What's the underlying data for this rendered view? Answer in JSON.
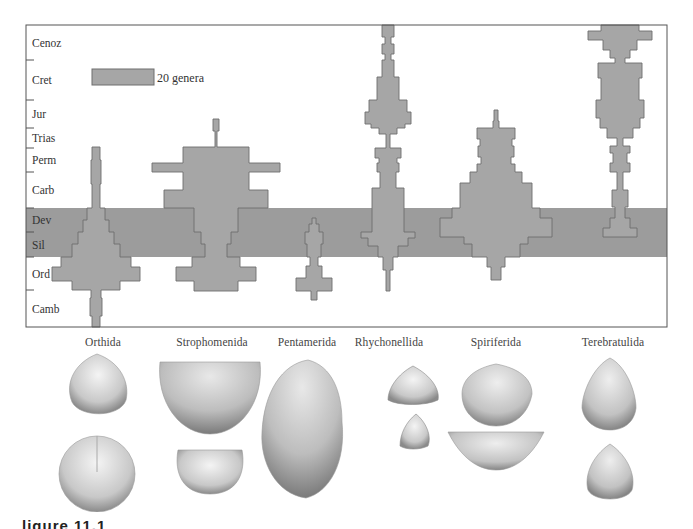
{
  "chart_data": {
    "type": "spindle",
    "title": "",
    "xlabel": "",
    "ylabel": "Geologic period",
    "legend": {
      "label": "20 genera",
      "width_px": 62,
      "genera": 20
    },
    "periods": [
      "Cenoz",
      "Cret",
      "Jur",
      "Trias",
      "Perm",
      "Carb",
      "Dev",
      "Sil",
      "Ord",
      "Camb"
    ],
    "period_boundaries_px": [
      25,
      60,
      100,
      128,
      148,
      172,
      208,
      232,
      257,
      290,
      327
    ],
    "highlight_band": {
      "from": "Dev",
      "to": "Sil",
      "color": "#9a9a9a"
    },
    "colors": {
      "fill": "#a6a6a6",
      "stroke": "#6e6e6e",
      "band": "#9c9c9c",
      "frame": "#555555"
    },
    "frame": {
      "x0": 26,
      "y0": 25,
      "x1": 667,
      "y1": 327
    },
    "series": [
      {
        "name": "Orthida",
        "cx": 96,
        "approx_max_genera": 30,
        "steps": [
          [
            147,
            160,
            4
          ],
          [
            160,
            184,
            5
          ],
          [
            184,
            208,
            4
          ],
          [
            208,
            220,
            9
          ],
          [
            220,
            232,
            13
          ],
          [
            232,
            244,
            18
          ],
          [
            244,
            257,
            24
          ],
          [
            257,
            267,
            35
          ],
          [
            267,
            281,
            44
          ],
          [
            281,
            290,
            24
          ],
          [
            290,
            298,
            5
          ],
          [
            298,
            316,
            6
          ],
          [
            316,
            327,
            4
          ]
        ]
      },
      {
        "name": "Strophomenida",
        "cx": 216,
        "approx_max_genera": 45,
        "steps": [
          [
            119,
            131,
            3
          ],
          [
            131,
            147,
            1
          ],
          [
            147,
            163,
            33
          ],
          [
            163,
            172,
            64
          ],
          [
            172,
            190,
            33
          ],
          [
            190,
            208,
            52
          ],
          [
            208,
            232,
            22
          ],
          [
            232,
            244,
            15
          ],
          [
            244,
            257,
            11
          ],
          [
            257,
            267,
            24
          ],
          [
            267,
            281,
            40
          ],
          [
            281,
            291,
            22
          ]
        ]
      },
      {
        "name": "Pentamerida",
        "cx": 314,
        "approx_max_genera": 12,
        "steps": [
          [
            218,
            224,
            2
          ],
          [
            224,
            232,
            5
          ],
          [
            232,
            244,
            9
          ],
          [
            244,
            257,
            7
          ],
          [
            257,
            266,
            4
          ],
          [
            266,
            278,
            8
          ],
          [
            278,
            291,
            18
          ],
          [
            291,
            300,
            3
          ]
        ]
      },
      {
        "name": "Rhychonellida",
        "cx": 388,
        "approx_max_genera": 28,
        "steps": [
          [
            25,
            37,
            6
          ],
          [
            37,
            44,
            3
          ],
          [
            44,
            54,
            6
          ],
          [
            54,
            60,
            3
          ],
          [
            60,
            77,
            6
          ],
          [
            77,
            100,
            11
          ],
          [
            100,
            112,
            19
          ],
          [
            112,
            124,
            23
          ],
          [
            124,
            128,
            17
          ],
          [
            128,
            134,
            9
          ],
          [
            134,
            148,
            2
          ],
          [
            148,
            158,
            13
          ],
          [
            158,
            163,
            9
          ],
          [
            163,
            172,
            11
          ],
          [
            172,
            188,
            8
          ],
          [
            188,
            208,
            16
          ],
          [
            208,
            232,
            16
          ],
          [
            232,
            238,
            27
          ],
          [
            238,
            246,
            20
          ],
          [
            246,
            257,
            10
          ],
          [
            257,
            270,
            5
          ],
          [
            270,
            291,
            2
          ]
        ]
      },
      {
        "name": "Spiriferida",
        "cx": 496,
        "approx_max_genera": 38,
        "steps": [
          [
            110,
            121,
            2
          ],
          [
            121,
            128,
            3
          ],
          [
            128,
            139,
            19
          ],
          [
            139,
            146,
            16
          ],
          [
            146,
            157,
            18
          ],
          [
            157,
            164,
            15
          ],
          [
            164,
            172,
            19
          ],
          [
            172,
            183,
            26
          ],
          [
            183,
            208,
            36
          ],
          [
            208,
            218,
            44
          ],
          [
            218,
            237,
            56
          ],
          [
            237,
            244,
            32
          ],
          [
            244,
            257,
            24
          ],
          [
            257,
            267,
            9
          ],
          [
            267,
            280,
            5
          ]
        ]
      },
      {
        "name": "Terebratulida",
        "cx": 620,
        "approx_max_genera": 27,
        "steps": [
          [
            25,
            31,
            19
          ],
          [
            31,
            40,
            32
          ],
          [
            40,
            50,
            17
          ],
          [
            50,
            58,
            10
          ],
          [
            58,
            63,
            5
          ],
          [
            63,
            78,
            22
          ],
          [
            78,
            100,
            19
          ],
          [
            100,
            118,
            24
          ],
          [
            118,
            128,
            20
          ],
          [
            128,
            138,
            13
          ],
          [
            138,
            146,
            3
          ],
          [
            146,
            153,
            10
          ],
          [
            153,
            163,
            7
          ],
          [
            163,
            172,
            10
          ],
          [
            172,
            190,
            3
          ],
          [
            190,
            207,
            8
          ],
          [
            207,
            218,
            5
          ],
          [
            218,
            228,
            10
          ],
          [
            228,
            237,
            17
          ]
        ]
      }
    ]
  },
  "orders": [
    {
      "name": "Orthida",
      "x": 103
    },
    {
      "name": "Strophomenida",
      "x": 212
    },
    {
      "name": "Pentamerida",
      "x": 307
    },
    {
      "name": "Rhychonellida",
      "x": 389
    },
    {
      "name": "Spiriferida",
      "x": 496
    },
    {
      "name": "Terebratulida",
      "x": 613
    }
  ],
  "figure_caption_fragment": "ligure 11.1"
}
